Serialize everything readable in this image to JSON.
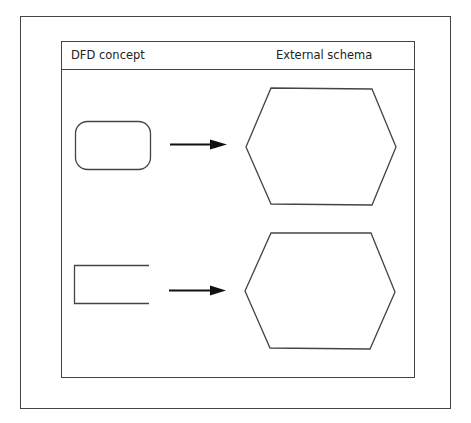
{
  "figure": {
    "header": {
      "left_label": "DFD concept",
      "right_label": "External schema"
    },
    "rows": [
      {
        "dfd_shape": "rounded-rectangle",
        "dfd_meaning": "process",
        "arrow": "right-arrow",
        "schema_shape": "hexagon"
      },
      {
        "dfd_shape": "open-rectangle",
        "dfd_meaning": "data-store",
        "arrow": "right-arrow",
        "schema_shape": "hexagon"
      }
    ],
    "colors": {
      "stroke": "#444444",
      "background": "#ffffff",
      "text": "#222222"
    }
  }
}
